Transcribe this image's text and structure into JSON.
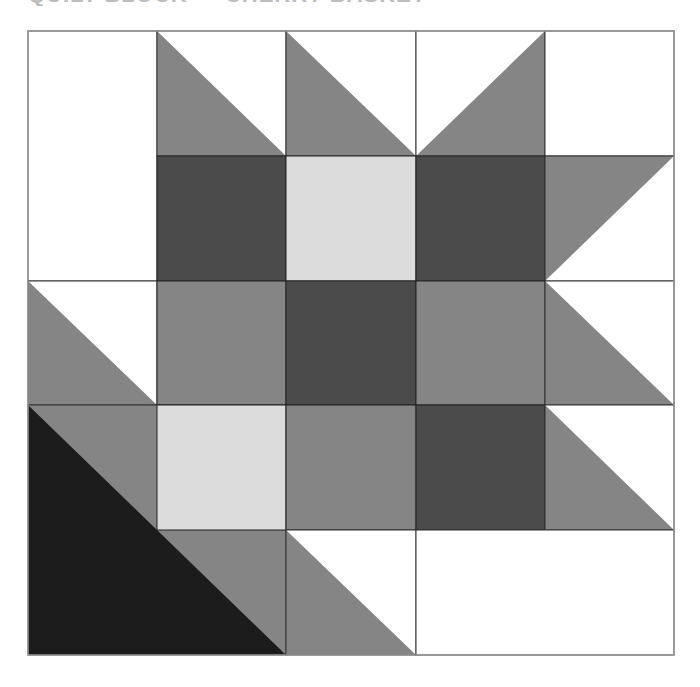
{
  "header": {
    "title": "QUILT BLOCK — CHERRY BASKET",
    "title_note": "clipped at top edge; only bottom sliver visible"
  },
  "quilt": {
    "grid": {
      "rows": 5,
      "cols": 5,
      "left": 28,
      "top": 31,
      "right": 674,
      "bottom": 655,
      "col_x": [
        28,
        157,
        286,
        416,
        545,
        674
      ],
      "row_y": [
        31,
        156,
        281,
        405,
        530,
        655
      ]
    },
    "colors": {
      "white": "#ffffff",
      "light": "#dcdcdc",
      "medium": "#858585",
      "dark": "#4b4b4b",
      "black": "#1c1c1c",
      "line": "#333333",
      "outer_border": "#999999"
    },
    "pieces": [
      {
        "id": "r0-1c0",
        "shape": "rect",
        "rows": [
          0,
          1
        ],
        "cols": [
          0,
          0
        ],
        "fill": "white"
      },
      {
        "id": "r0c1",
        "shape": "hst",
        "row": 0,
        "col": 1,
        "shaded": "lower-left",
        "fill": "medium",
        "other": "white"
      },
      {
        "id": "r0c2",
        "shape": "hst",
        "row": 0,
        "col": 2,
        "shaded": "lower-left",
        "fill": "medium",
        "other": "white"
      },
      {
        "id": "r0c3",
        "shape": "hst",
        "row": 0,
        "col": 3,
        "shaded": "lower-right",
        "fill": "medium",
        "other": "white"
      },
      {
        "id": "r0c4",
        "shape": "rect",
        "row": 0,
        "col": 4,
        "fill": "white"
      },
      {
        "id": "r1c1",
        "shape": "rect",
        "row": 1,
        "col": 1,
        "fill": "dark"
      },
      {
        "id": "r1c2",
        "shape": "rect",
        "row": 1,
        "col": 2,
        "fill": "light"
      },
      {
        "id": "r1c3",
        "shape": "rect",
        "row": 1,
        "col": 3,
        "fill": "dark"
      },
      {
        "id": "r1c4",
        "shape": "hst",
        "row": 1,
        "col": 4,
        "shaded": "upper-left",
        "fill": "medium",
        "other": "white"
      },
      {
        "id": "r2c0",
        "shape": "hst",
        "row": 2,
        "col": 0,
        "shaded": "lower-left",
        "fill": "medium",
        "other": "white"
      },
      {
        "id": "r2c1",
        "shape": "rect",
        "row": 2,
        "col": 1,
        "fill": "medium"
      },
      {
        "id": "r2c2",
        "shape": "rect",
        "row": 2,
        "col": 2,
        "fill": "dark"
      },
      {
        "id": "r2c3",
        "shape": "rect",
        "row": 2,
        "col": 3,
        "fill": "medium"
      },
      {
        "id": "r2c4",
        "shape": "hst",
        "row": 2,
        "col": 4,
        "shaded": "lower-left",
        "fill": "medium",
        "other": "white"
      },
      {
        "id": "r3-4c0-1",
        "shape": "hst",
        "rows": [
          3,
          4
        ],
        "cols": [
          0,
          1
        ],
        "shaded": "lower-left",
        "fill": "black",
        "other": "medium"
      },
      {
        "id": "r3c1",
        "shape": "rect",
        "row": 3,
        "col": 1,
        "fill": "light"
      },
      {
        "id": "r3c2",
        "shape": "rect",
        "row": 3,
        "col": 2,
        "fill": "medium"
      },
      {
        "id": "r3c3",
        "shape": "rect",
        "row": 3,
        "col": 3,
        "fill": "dark"
      },
      {
        "id": "r3c4",
        "shape": "hst",
        "row": 3,
        "col": 4,
        "shaded": "lower-left",
        "fill": "medium",
        "other": "white"
      },
      {
        "id": "r4c2",
        "shape": "hst",
        "row": 4,
        "col": 2,
        "shaded": "lower-left",
        "fill": "medium",
        "other": "white"
      },
      {
        "id": "r4c3-4",
        "shape": "rect",
        "row": 4,
        "cols": [
          3,
          4
        ],
        "fill": "white"
      }
    ]
  }
}
